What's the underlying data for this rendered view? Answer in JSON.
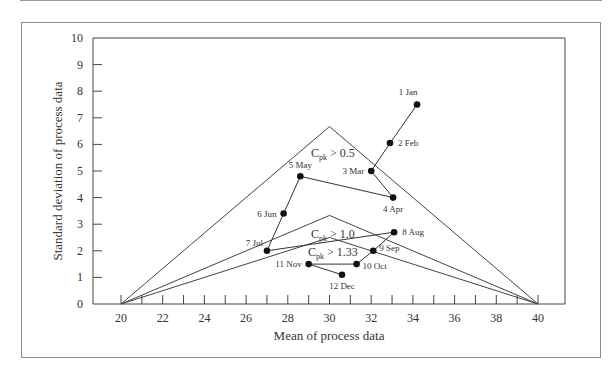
{
  "chart_data": {
    "type": "line",
    "title": "",
    "xlabel": "Mean of process data",
    "ylabel": "Standard deviation of process data",
    "xlim": [
      18.7,
      41.3
    ],
    "ylim": [
      0,
      10
    ],
    "x_ticks": [
      20,
      22,
      24,
      26,
      28,
      30,
      32,
      34,
      36,
      38,
      40
    ],
    "x_minor_ticks": [
      21,
      23,
      25,
      27,
      29,
      31,
      33,
      35,
      37,
      39
    ],
    "y_ticks": [
      0,
      1,
      2,
      3,
      4,
      5,
      6,
      7,
      8,
      9,
      10
    ],
    "grid": false,
    "series": [
      {
        "name": "Monthly process performance",
        "points": [
          {
            "label": "1 Jan",
            "x": 34.2,
            "y": 7.5
          },
          {
            "label": "2 Feb",
            "x": 32.9,
            "y": 6.05
          },
          {
            "label": "3 Mar",
            "x": 32.0,
            "y": 5.0
          },
          {
            "label": "4 Apr",
            "x": 33.05,
            "y": 4.0
          },
          {
            "label": "5 May",
            "x": 28.6,
            "y": 4.8
          },
          {
            "label": "6 Jun",
            "x": 27.8,
            "y": 3.4
          },
          {
            "label": "7 Jul",
            "x": 27.0,
            "y": 2.0
          },
          {
            "label": "8 Aug",
            "x": 33.1,
            "y": 2.7
          },
          {
            "label": "9 Sep",
            "x": 32.1,
            "y": 2.0
          },
          {
            "label": "10 Oct",
            "x": 31.3,
            "y": 1.5
          },
          {
            "label": "11 Nov",
            "x": 29.0,
            "y": 1.5
          },
          {
            "label": "12 Dec",
            "x": 30.6,
            "y": 1.1
          }
        ]
      }
    ],
    "regions": [
      {
        "name": "Cpk > 0.5",
        "cpk": 0.5,
        "vertices": [
          [
            20,
            0
          ],
          [
            30,
            6.67
          ],
          [
            40,
            0
          ]
        ]
      },
      {
        "name": "Cpk > 1.0",
        "cpk": 1.0,
        "vertices": [
          [
            20,
            0
          ],
          [
            30,
            3.33
          ],
          [
            40,
            0
          ]
        ]
      },
      {
        "name": "Cpk > 1.33",
        "cpk": 1.33,
        "vertices": [
          [
            20,
            0
          ],
          [
            30,
            2.5
          ],
          [
            40,
            0
          ]
        ]
      }
    ],
    "spec_limits": {
      "lower": 20,
      "upper": 40
    }
  },
  "labels": {
    "xlabel": "Mean of process data",
    "ylabel": "Standard deviation of process data",
    "region_05": {
      "C": "C",
      "sub": "pk",
      "rest": " > 0.5"
    },
    "region_10": {
      "C": "C",
      "sub": "pk",
      "rest": " > 1.0"
    },
    "region_133": {
      "C": "C",
      "sub": "pk",
      "rest": " > 1.33"
    }
  }
}
